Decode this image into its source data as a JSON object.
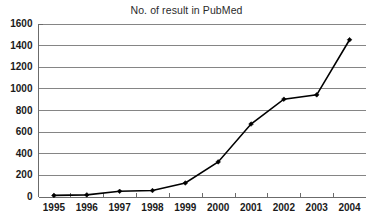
{
  "chart_data": {
    "type": "line",
    "title": "No. of result in PubMed",
    "xlabel": "",
    "ylabel": "",
    "categories": [
      "1995",
      "1996",
      "1997",
      "1998",
      "1999",
      "2000",
      "2001",
      "2002",
      "2003",
      "2004"
    ],
    "values": [
      10,
      15,
      48,
      55,
      125,
      320,
      670,
      900,
      940,
      1450
    ],
    "series": [
      {
        "name": "No. of result in PubMed",
        "values": [
          10,
          15,
          48,
          55,
          125,
          320,
          670,
          900,
          940,
          1450
        ]
      }
    ],
    "ylim": [
      0,
      1600
    ],
    "y_ticks": [
      0,
      200,
      400,
      600,
      800,
      1000,
      1200,
      1400,
      1600
    ],
    "y_tick_labels": [
      "0",
      "200",
      "400",
      "600",
      "800",
      "1000",
      "1200",
      "1400",
      "1600"
    ],
    "grid": true,
    "legend": false,
    "legend_position": "none",
    "marker": "diamond",
    "line_color": "#000000",
    "grid_color": "#858585",
    "background_color": "#ffffff"
  }
}
